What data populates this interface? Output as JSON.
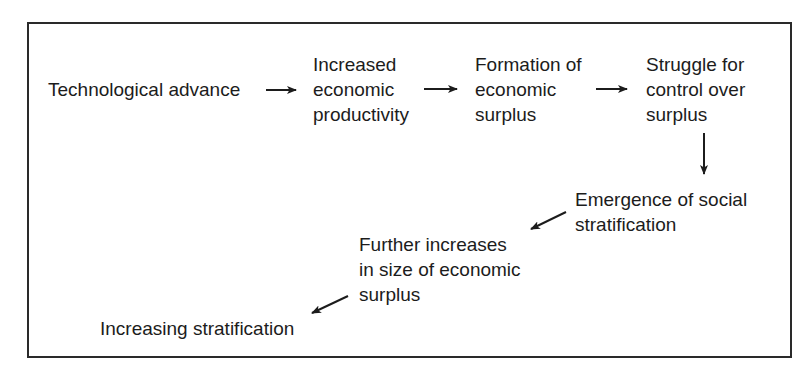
{
  "diagram": {
    "type": "flowchart",
    "nodes": [
      {
        "id": "tech",
        "lines": [
          "Technological advance"
        ]
      },
      {
        "id": "productivity",
        "lines": [
          "Increased",
          "economic",
          "productivity"
        ]
      },
      {
        "id": "surplus",
        "lines": [
          "Formation of",
          "economic",
          "surplus"
        ]
      },
      {
        "id": "struggle",
        "lines": [
          "Struggle for",
          "control over",
          "surplus"
        ]
      },
      {
        "id": "emergence",
        "lines": [
          "Emergence of social",
          "stratification"
        ]
      },
      {
        "id": "further",
        "lines": [
          "Further increases",
          "in size of economic",
          "surplus"
        ]
      },
      {
        "id": "increasing",
        "lines": [
          "Increasing stratification"
        ]
      }
    ],
    "edges": [
      {
        "from": "tech",
        "to": "productivity",
        "direction": "right"
      },
      {
        "from": "productivity",
        "to": "surplus",
        "direction": "right"
      },
      {
        "from": "surplus",
        "to": "struggle",
        "direction": "right"
      },
      {
        "from": "struggle",
        "to": "emergence",
        "direction": "down"
      },
      {
        "from": "emergence",
        "to": "further",
        "direction": "down-left"
      },
      {
        "from": "further",
        "to": "increasing",
        "direction": "down-left"
      }
    ],
    "colors": {
      "line": "#1c1c1c",
      "background": "#ffffff"
    }
  }
}
